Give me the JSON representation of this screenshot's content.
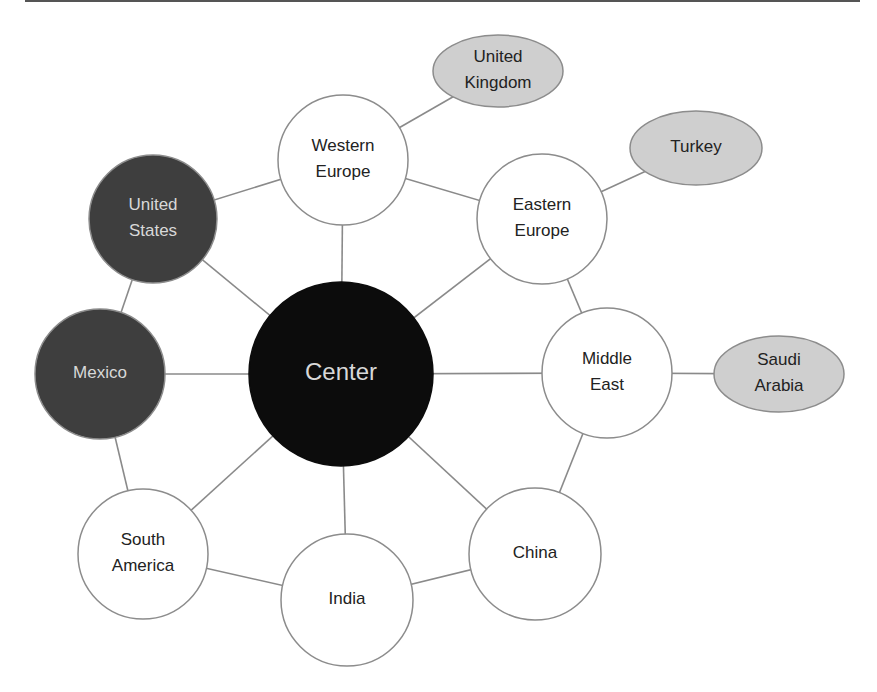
{
  "colors": {
    "background": "#ffffff",
    "edge": "#8a8a8a",
    "outline": "#8c8c8c",
    "center_fill": "#0c0c0c",
    "dark_fill": "#3e3e3e",
    "light_fill": "#ffffff",
    "gray_fill": "#cfcfcf",
    "text_dark": "#222222",
    "text_light": "#d8d8d8"
  },
  "nodes": [
    {
      "id": "center",
      "label": [
        "Center"
      ],
      "shape": "circle",
      "cx": 341,
      "cy": 374,
      "r": 92,
      "style": "center"
    },
    {
      "id": "united-states",
      "label": [
        "United",
        "States"
      ],
      "shape": "circle",
      "cx": 153,
      "cy": 219,
      "r": 64,
      "style": "dark"
    },
    {
      "id": "mexico",
      "label": [
        "Mexico"
      ],
      "shape": "circle",
      "cx": 100,
      "cy": 374,
      "r": 65,
      "style": "dark"
    },
    {
      "id": "western-europe",
      "label": [
        "Western",
        "Europe"
      ],
      "shape": "circle",
      "cx": 343,
      "cy": 160,
      "r": 65,
      "style": "light"
    },
    {
      "id": "eastern-europe",
      "label": [
        "Eastern",
        "Europe"
      ],
      "shape": "circle",
      "cx": 542,
      "cy": 219,
      "r": 65,
      "style": "light"
    },
    {
      "id": "middle-east",
      "label": [
        "Middle",
        "East"
      ],
      "shape": "circle",
      "cx": 607,
      "cy": 373,
      "r": 65,
      "style": "light"
    },
    {
      "id": "china",
      "label": [
        "China"
      ],
      "shape": "circle",
      "cx": 535,
      "cy": 554,
      "r": 66,
      "style": "light"
    },
    {
      "id": "india",
      "label": [
        "India"
      ],
      "shape": "circle",
      "cx": 347,
      "cy": 600,
      "r": 66,
      "style": "light"
    },
    {
      "id": "south-america",
      "label": [
        "South",
        "America"
      ],
      "shape": "circle",
      "cx": 143,
      "cy": 554,
      "r": 65,
      "style": "light"
    },
    {
      "id": "united-kingdom",
      "label": [
        "United",
        "Kingdom"
      ],
      "shape": "ellipse",
      "cx": 498,
      "cy": 71,
      "rx": 65,
      "ry": 36,
      "style": "gray"
    },
    {
      "id": "turkey",
      "label": [
        "Turkey"
      ],
      "shape": "ellipse",
      "cx": 696,
      "cy": 148,
      "rx": 66,
      "ry": 37,
      "style": "gray"
    },
    {
      "id": "saudi-arabia",
      "label": [
        "Saudi",
        "Arabia"
      ],
      "shape": "ellipse",
      "cx": 779,
      "cy": 374,
      "rx": 65,
      "ry": 38,
      "style": "gray"
    }
  ],
  "edges": [
    [
      "center",
      "united-states"
    ],
    [
      "center",
      "mexico"
    ],
    [
      "center",
      "western-europe"
    ],
    [
      "center",
      "eastern-europe"
    ],
    [
      "center",
      "middle-east"
    ],
    [
      "center",
      "china"
    ],
    [
      "center",
      "india"
    ],
    [
      "center",
      "south-america"
    ],
    [
      "united-states",
      "western-europe"
    ],
    [
      "united-states",
      "mexico"
    ],
    [
      "mexico",
      "south-america"
    ],
    [
      "south-america",
      "india"
    ],
    [
      "india",
      "china"
    ],
    [
      "china",
      "middle-east"
    ],
    [
      "middle-east",
      "eastern-europe"
    ],
    [
      "eastern-europe",
      "western-europe"
    ],
    [
      "western-europe",
      "united-kingdom"
    ],
    [
      "eastern-europe",
      "turkey"
    ],
    [
      "middle-east",
      "saudi-arabia"
    ]
  ]
}
